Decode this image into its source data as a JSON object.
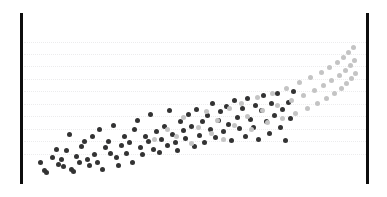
{
  "figure": {
    "width": 387,
    "height": 197,
    "background": "#ffffff"
  },
  "axes": {
    "left_bar": {
      "x": 20,
      "y": 13,
      "width": 3,
      "height": 171,
      "color": "#0d0d0d"
    },
    "right_bar": {
      "x": 366,
      "y": 13,
      "width": 3,
      "height": 171,
      "color": "#0d0d0d"
    },
    "grid": {
      "color": "#ececed",
      "style": "dotted",
      "x_start": 24,
      "x_end": 366,
      "y_positions": [
        42,
        54,
        66,
        79,
        91,
        104,
        116,
        129,
        141,
        154
      ]
    }
  },
  "chart_data": {
    "type": "scatter",
    "title": "",
    "xlabel": "",
    "ylabel": "",
    "xlim": [
      0,
      1
    ],
    "ylim": [
      0,
      1
    ],
    "grid": true,
    "legend": "none",
    "marker_size_px": 5,
    "series": [
      {
        "name": "dark-group",
        "color": "#333333",
        "points": [
          [
            0.042,
            0.118
          ],
          [
            0.055,
            0.062
          ],
          [
            0.062,
            0.05
          ],
          [
            0.078,
            0.152
          ],
          [
            0.09,
            0.205
          ],
          [
            0.098,
            0.105
          ],
          [
            0.105,
            0.135
          ],
          [
            0.112,
            0.088
          ],
          [
            0.12,
            0.198
          ],
          [
            0.128,
            0.305
          ],
          [
            0.136,
            0.072
          ],
          [
            0.142,
            0.06
          ],
          [
            0.15,
            0.16
          ],
          [
            0.158,
            0.118
          ],
          [
            0.166,
            0.225
          ],
          [
            0.175,
            0.255
          ],
          [
            0.182,
            0.135
          ],
          [
            0.19,
            0.098
          ],
          [
            0.198,
            0.288
          ],
          [
            0.205,
            0.172
          ],
          [
            0.212,
            0.12
          ],
          [
            0.22,
            0.34
          ],
          [
            0.228,
            0.068
          ],
          [
            0.236,
            0.218
          ],
          [
            0.245,
            0.255
          ],
          [
            0.252,
            0.18
          ],
          [
            0.26,
            0.365
          ],
          [
            0.268,
            0.152
          ],
          [
            0.276,
            0.098
          ],
          [
            0.284,
            0.228
          ],
          [
            0.292,
            0.292
          ],
          [
            0.3,
            0.175
          ],
          [
            0.308,
            0.248
          ],
          [
            0.316,
            0.12
          ],
          [
            0.324,
            0.34
          ],
          [
            0.332,
            0.395
          ],
          [
            0.34,
            0.215
          ],
          [
            0.348,
            0.168
          ],
          [
            0.356,
            0.292
          ],
          [
            0.364,
            0.255
          ],
          [
            0.372,
            0.438
          ],
          [
            0.38,
            0.205
          ],
          [
            0.388,
            0.325
          ],
          [
            0.396,
            0.182
          ],
          [
            0.404,
            0.272
          ],
          [
            0.412,
            0.358
          ],
          [
            0.42,
            0.228
          ],
          [
            0.428,
            0.462
          ],
          [
            0.436,
            0.305
          ],
          [
            0.444,
            0.252
          ],
          [
            0.452,
            0.198
          ],
          [
            0.46,
            0.392
          ],
          [
            0.468,
            0.33
          ],
          [
            0.476,
            0.275
          ],
          [
            0.484,
            0.44
          ],
          [
            0.492,
            0.358
          ],
          [
            0.5,
            0.222
          ],
          [
            0.508,
            0.472
          ],
          [
            0.516,
            0.3
          ],
          [
            0.524,
            0.388
          ],
          [
            0.532,
            0.248
          ],
          [
            0.54,
            0.428
          ],
          [
            0.548,
            0.34
          ],
          [
            0.556,
            0.51
          ],
          [
            0.564,
            0.282
          ],
          [
            0.572,
            0.398
          ],
          [
            0.58,
            0.455
          ],
          [
            0.588,
            0.322
          ],
          [
            0.596,
            0.488
          ],
          [
            0.604,
            0.368
          ],
          [
            0.612,
            0.262
          ],
          [
            0.62,
            0.53
          ],
          [
            0.628,
            0.418
          ],
          [
            0.636,
            0.345
          ],
          [
            0.644,
            0.478
          ],
          [
            0.652,
            0.292
          ],
          [
            0.66,
            0.545
          ],
          [
            0.668,
            0.405
          ],
          [
            0.676,
            0.352
          ],
          [
            0.684,
            0.495
          ],
          [
            0.692,
            0.268
          ],
          [
            0.7,
            0.462
          ],
          [
            0.708,
            0.562
          ],
          [
            0.716,
            0.388
          ],
          [
            0.724,
            0.308
          ],
          [
            0.732,
            0.512
          ],
          [
            0.74,
            0.43
          ],
          [
            0.748,
            0.578
          ],
          [
            0.756,
            0.352
          ],
          [
            0.764,
            0.468
          ],
          [
            0.772,
            0.262
          ],
          [
            0.78,
            0.52
          ],
          [
            0.788,
            0.408
          ],
          [
            0.796,
            0.592
          ]
        ]
      },
      {
        "name": "light-group",
        "color": "#c4c4c4",
        "points": [
          [
            0.382,
            0.268
          ],
          [
            0.42,
            0.338
          ],
          [
            0.448,
            0.292
          ],
          [
            0.47,
            0.418
          ],
          [
            0.492,
            0.245
          ],
          [
            0.512,
            0.352
          ],
          [
            0.536,
            0.455
          ],
          [
            0.552,
            0.312
          ],
          [
            0.57,
            0.398
          ],
          [
            0.588,
            0.272
          ],
          [
            0.605,
            0.478
          ],
          [
            0.622,
            0.362
          ],
          [
            0.64,
            0.512
          ],
          [
            0.658,
            0.425
          ],
          [
            0.672,
            0.338
          ],
          [
            0.688,
            0.548
          ],
          [
            0.704,
            0.462
          ],
          [
            0.718,
            0.385
          ],
          [
            0.734,
            0.578
          ],
          [
            0.748,
            0.498
          ],
          [
            0.762,
            0.412
          ],
          [
            0.776,
            0.612
          ],
          [
            0.79,
            0.528
          ],
          [
            0.802,
            0.445
          ],
          [
            0.814,
            0.648
          ],
          [
            0.826,
            0.562
          ],
          [
            0.838,
            0.478
          ],
          [
            0.848,
            0.682
          ],
          [
            0.858,
            0.595
          ],
          [
            0.868,
            0.512
          ],
          [
            0.878,
            0.715
          ],
          [
            0.886,
            0.628
          ],
          [
            0.894,
            0.545
          ],
          [
            0.902,
            0.748
          ],
          [
            0.91,
            0.662
          ],
          [
            0.918,
            0.578
          ],
          [
            0.926,
            0.782
          ],
          [
            0.932,
            0.695
          ],
          [
            0.938,
            0.612
          ],
          [
            0.944,
            0.815
          ],
          [
            0.95,
            0.728
          ],
          [
            0.955,
            0.645
          ],
          [
            0.96,
            0.848
          ],
          [
            0.965,
            0.762
          ],
          [
            0.97,
            0.678
          ],
          [
            0.974,
            0.882
          ],
          [
            0.978,
            0.795
          ],
          [
            0.982,
            0.712
          ]
        ]
      }
    ]
  }
}
